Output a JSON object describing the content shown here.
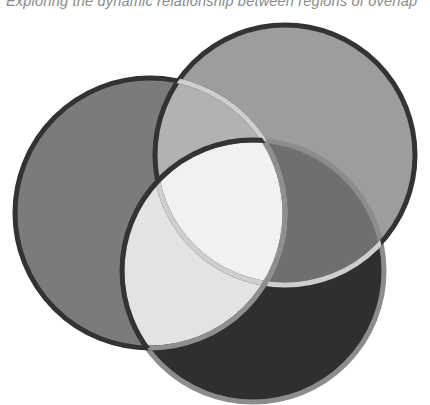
{
  "caption": "Exploring the dynamic relationship between regions of overlap",
  "diagram": {
    "type": "venn",
    "sets": [
      {
        "id": "left",
        "cx": 150,
        "cy": 213,
        "r": 135,
        "fill": "#7b7b7b",
        "stroke": "#333333"
      },
      {
        "id": "top",
        "cx": 285,
        "cy": 155,
        "r": 130,
        "fill": "#9d9d9d",
        "stroke": "#333333"
      },
      {
        "id": "bottom",
        "cx": 253,
        "cy": 271,
        "r": 131,
        "fill": "#2f2f2f",
        "stroke": "#8c8c8c"
      }
    ],
    "regions": {
      "left_top": "#b2b2b2",
      "left_bottom": "#e3e3e3",
      "top_bottom": "#6f6f6f",
      "center": "#f1f1f1"
    },
    "highlight_stroke": "#cfcfcf"
  }
}
